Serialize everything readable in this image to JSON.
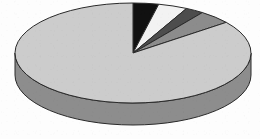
{
  "chart_data": {
    "type": "pie",
    "title": "",
    "subtitle": "",
    "xlabel": "",
    "ylabel": "",
    "legend": [],
    "annotations": [],
    "grid": false,
    "legend_position": "none",
    "three_d": true,
    "start_angle_deg": 0,
    "direction": "clockwise",
    "categories": [
      "Slice 1",
      "Slice 2",
      "Slice 3",
      "Slice 4",
      "Slice 5"
    ],
    "values": [
      3.5,
      4.0,
      2.5,
      4.5,
      85.5
    ],
    "colors": [
      "#111111",
      "#f2f2f2",
      "#4d4d4d",
      "#8c8c8c",
      "#cccccc"
    ],
    "side_colors": [
      "#0a0a0a",
      "#a8a8a8",
      "#343434",
      "#626262",
      "#8d8d8d"
    ],
    "slices": [
      {
        "label": "Slice 1",
        "value": 3.5,
        "color": "#111111",
        "side_color": "#0a0a0a",
        "start_deg": 0.0,
        "end_deg": 12.6
      },
      {
        "label": "Slice 2",
        "value": 4.0,
        "color": "#f2f2f2",
        "side_color": "#a8a8a8",
        "start_deg": 12.6,
        "end_deg": 27.0
      },
      {
        "label": "Slice 3",
        "value": 2.5,
        "color": "#4d4d4d",
        "side_color": "#343434",
        "start_deg": 27.0,
        "end_deg": 36.0
      },
      {
        "label": "Slice 4",
        "value": 4.5,
        "color": "#8c8c8c",
        "side_color": "#626262",
        "start_deg": 36.0,
        "end_deg": 52.2
      },
      {
        "label": "Slice 5",
        "value": 85.5,
        "color": "#cccccc",
        "side_color": "#8d8d8d",
        "start_deg": 52.2,
        "end_deg": 360.0
      }
    ],
    "geometry": {
      "center_x": 133,
      "center_y": 53,
      "radius_x": 118,
      "radius_y": 50,
      "depth": 22,
      "outline_color": "#2a2a2a",
      "outline_width": 1.0
    },
    "background_color": "#fdfdfd"
  }
}
